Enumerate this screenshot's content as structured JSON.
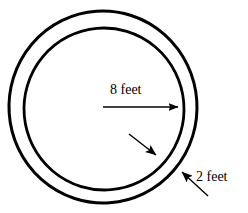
{
  "figure": {
    "background_color": "#ffffff",
    "stroke_color": "#000000",
    "width": 248,
    "height": 213,
    "shape_type": "annulus"
  },
  "labels": {
    "radius_label": "8 feet",
    "thickness_label": "2 feet"
  },
  "measurements": [
    {
      "name": "inner-radius",
      "value": 8,
      "unit": "feet",
      "text": "8 feet",
      "annotation": "single horizontal arrow from center to inner circle"
    },
    {
      "name": "ring-thickness",
      "value": 2,
      "unit": "feet",
      "text": "2 feet",
      "annotation": "two opposing arrows spanning the band between inner and outer circle"
    }
  ],
  "geometry": {
    "outer_circle": {
      "name": "outer-circle",
      "cx": 103,
      "cy": 107,
      "rx": 94,
      "ry": 96,
      "stroke_width": 3.0
    },
    "inner_circle": {
      "name": "inner-circle",
      "cx": 104,
      "cy": 109,
      "rx": 80,
      "ry": 81,
      "stroke_width": 2.8
    },
    "radius_arrow": {
      "x1": 103,
      "y1": 107,
      "x2": 184,
      "y2": 107
    },
    "thickness_arrow_upper": {
      "x1": 129,
      "y1": 134,
      "x2": 162,
      "y2": 160
    },
    "thickness_arrow_lower": {
      "x1": 208,
      "y1": 196,
      "x2": 176,
      "y2": 166
    }
  },
  "text_positions": {
    "radius_label_x": 110,
    "radius_label_y": 94,
    "thickness_label_x": 196,
    "thickness_label_y": 181
  }
}
